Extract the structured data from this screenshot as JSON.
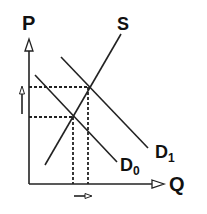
{
  "diagram": {
    "title": "",
    "axes": {
      "y_label": "P",
      "x_label": "Q"
    },
    "curves": {
      "supply": {
        "label": "S"
      },
      "demand_initial": {
        "label": "D",
        "subscript": "0"
      },
      "demand_shifted": {
        "label": "D",
        "subscript": "1"
      }
    },
    "annotations": {
      "price_change": "up-arrow",
      "quantity_change": "right-arrow"
    },
    "colors": {
      "line": "#222222",
      "background": "#ffffff"
    }
  }
}
